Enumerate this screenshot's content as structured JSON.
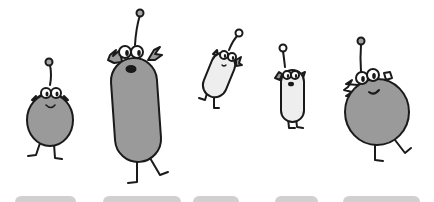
{
  "scene": {
    "description": "Five cartoon alien creatures with antennae jumping above grey platforms",
    "colors": {
      "background": "#ffffff",
      "outline": "#1a1a1a",
      "grey_body": "#9a9a9a",
      "white_body": "#eeeeee",
      "platform": "#d0d0d0",
      "antenna_ball_grey": "#a0a0a0"
    },
    "characters": [
      {
        "id": "alien-1",
        "shape": "round",
        "fill": "grey",
        "size": "small"
      },
      {
        "id": "alien-2",
        "shape": "tall-capsule",
        "fill": "grey",
        "size": "large"
      },
      {
        "id": "alien-3",
        "shape": "capsule",
        "fill": "white",
        "size": "small"
      },
      {
        "id": "alien-4",
        "shape": "capsule",
        "fill": "white",
        "size": "small"
      },
      {
        "id": "alien-5",
        "shape": "round",
        "fill": "grey",
        "size": "large"
      }
    ],
    "platforms": [
      {
        "x": 15,
        "width": 61
      },
      {
        "x": 103,
        "width": 78
      },
      {
        "x": 193,
        "width": 46
      },
      {
        "x": 275,
        "width": 43
      },
      {
        "x": 343,
        "width": 77
      }
    ]
  }
}
